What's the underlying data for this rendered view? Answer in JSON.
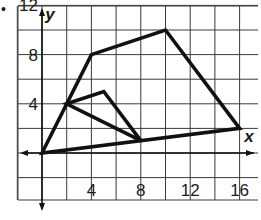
{
  "figure": {
    "marker": "•",
    "x_axis_label": "x",
    "y_axis_label": "y",
    "x_ticks": [
      {
        "value": 4,
        "label": "4"
      },
      {
        "value": 8,
        "label": "8"
      },
      {
        "value": 12,
        "label": "12"
      },
      {
        "value": 16,
        "label": "16"
      }
    ],
    "y_ticks": [
      {
        "value": 4,
        "label": "4"
      },
      {
        "value": 8,
        "label": "8"
      },
      {
        "value": 12,
        "label": "12"
      }
    ],
    "grid": {
      "x_min": -2,
      "x_max": 17.5,
      "y_min": -2,
      "y_max": 12,
      "step": 2
    },
    "shapes": [
      {
        "name": "outer-quadrilateral",
        "vertices": [
          [
            0,
            0
          ],
          [
            4,
            8
          ],
          [
            10,
            10
          ],
          [
            16,
            2
          ]
        ]
      },
      {
        "name": "inner-triangle",
        "vertices": [
          [
            2,
            4
          ],
          [
            5,
            5
          ],
          [
            8,
            1
          ]
        ]
      }
    ],
    "colors": {
      "grid": "#3a3a3a",
      "shape": "#111111",
      "text": "#1a1a1a"
    }
  }
}
